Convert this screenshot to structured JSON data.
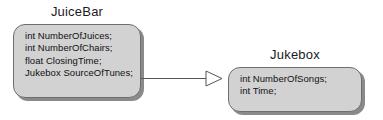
{
  "diagram": {
    "type": "uml-class-association",
    "background_color": "#ffffff",
    "box_fill_color": "#d2d2d2",
    "box_border_color": "#6e6e6e",
    "shadow_color": "#8a8a8a",
    "text_color": "#111111",
    "classes": [
      {
        "name": "JuiceBar",
        "attributes": [
          "int NumberOfJuices;",
          "int NumberOfChairs;",
          "float ClosingTime;",
          "Jukebox SourceOfTunes;"
        ]
      },
      {
        "name": "Jukebox",
        "attributes": [
          "int NumberOfSongs;",
          "int Time;"
        ]
      }
    ],
    "connector": {
      "kind": "association-arrow",
      "arrowhead": "hollow-triangle",
      "direction": "left-to-right",
      "from": "JuiceBar",
      "to": "Jukebox",
      "line_color": "#555555"
    }
  }
}
